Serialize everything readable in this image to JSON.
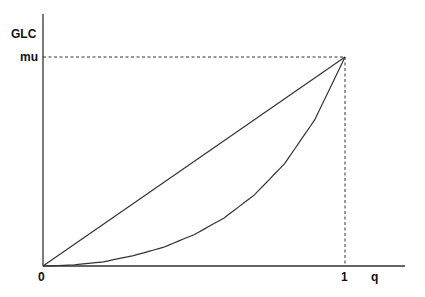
{
  "chart_data": {
    "type": "line",
    "title": "",
    "xlabel": "q",
    "ylabel": "GLC",
    "x_ticks": [
      "0",
      "1"
    ],
    "y_ticks": [
      "mu"
    ],
    "xlim": [
      0,
      1.18
    ],
    "ylim": [
      0,
      1.2
    ],
    "grid": false,
    "series": [
      {
        "name": "Line of equality",
        "x": [
          0,
          1
        ],
        "y": [
          0,
          1
        ],
        "style": "solid"
      },
      {
        "name": "Generalized Lorenz curve",
        "x": [
          0,
          0.1,
          0.2,
          0.3,
          0.4,
          0.5,
          0.6,
          0.7,
          0.8,
          0.9,
          1.0
        ],
        "y": [
          0,
          0.005,
          0.02,
          0.05,
          0.09,
          0.15,
          0.23,
          0.34,
          0.49,
          0.7,
          1.0
        ],
        "style": "solid"
      }
    ],
    "annotations": [
      {
        "type": "dashed-hline",
        "y": 1,
        "label": "mu",
        "from_x": 0,
        "to_x": 1
      },
      {
        "type": "dashed-vline",
        "x": 1,
        "from_y": 0,
        "to_y": 1
      }
    ]
  },
  "labels": {
    "y_axis": "GLC",
    "mu": "mu",
    "origin": "0",
    "one": "1",
    "x_axis": "q"
  }
}
